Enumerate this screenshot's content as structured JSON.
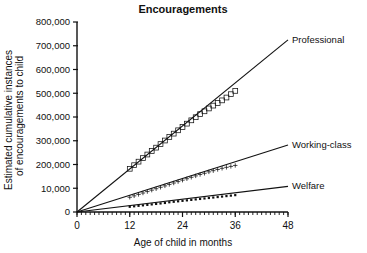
{
  "chart_data": {
    "type": "line",
    "title": "Encouragements",
    "xlabel": "Age of child in months",
    "ylabel": "Estimated cumulative instances of encouragements to child",
    "ylabel_line1": "Estimated cumulative instances",
    "ylabel_line2": "of encouragements to child",
    "xlim": [
      0,
      48
    ],
    "ylim": [
      0,
      800000
    ],
    "grid": false,
    "legend_position": "right-inline",
    "x_ticks": [
      0,
      12,
      24,
      36,
      48
    ],
    "x_tick_labels": [
      "0",
      "12",
      "24",
      "36",
      "48"
    ],
    "x_minor_tick_interval": 1,
    "y_ticks": [
      0,
      100000,
      200000,
      300000,
      400000,
      500000,
      600000,
      700000,
      800000
    ],
    "y_tick_labels": [
      "0",
      "10,000",
      "200,000",
      "300,000",
      "400,000",
      "500,000",
      "600,000",
      "700,000",
      "800,000"
    ],
    "series": [
      {
        "name": "Professional",
        "marker": "open-square",
        "label": "Professional",
        "trend_from": [
          0,
          0
        ],
        "trend_to": [
          48,
          725000
        ],
        "x": [
          12,
          13,
          14,
          15,
          16,
          17,
          18,
          19,
          20,
          21,
          22,
          23,
          24,
          25,
          26,
          27,
          28,
          29,
          30,
          31,
          32,
          33,
          34,
          35,
          36
        ],
        "values": [
          182000,
          197000,
          212000,
          227000,
          242000,
          257000,
          271000,
          286000,
          301000,
          316000,
          330000,
          344000,
          358000,
          372000,
          386000,
          399000,
          412000,
          424000,
          436000,
          448000,
          459000,
          470000,
          482000,
          496000,
          510000
        ]
      },
      {
        "name": "Working-class",
        "marker": "plus",
        "label": "Working-class",
        "trend_from": [
          0,
          0
        ],
        "trend_to": [
          48,
          282000
        ],
        "x": [
          12,
          13,
          14,
          15,
          16,
          17,
          18,
          19,
          20,
          21,
          22,
          23,
          24,
          25,
          26,
          27,
          28,
          29,
          30,
          31,
          32,
          33,
          34,
          35,
          36
        ],
        "values": [
          62000,
          68000,
          74000,
          80000,
          86000,
          92000,
          98000,
          104000,
          110000,
          116000,
          122000,
          128000,
          134000,
          140000,
          146000,
          152000,
          158000,
          163000,
          169000,
          174000,
          179000,
          184000,
          188000,
          192000,
          196000
        ]
      },
      {
        "name": "Welfare",
        "marker": "dot",
        "label": "Welfare",
        "trend_from": [
          0,
          0
        ],
        "trend_to": [
          48,
          108000
        ],
        "x": [
          12,
          13,
          14,
          15,
          16,
          17,
          18,
          19,
          20,
          21,
          22,
          23,
          24,
          25,
          26,
          27,
          28,
          29,
          30,
          31,
          32,
          33,
          34,
          35,
          36
        ],
        "values": [
          22000,
          24000,
          26000,
          28000,
          30000,
          32000,
          34000,
          36000,
          38000,
          41000,
          43000,
          45000,
          47000,
          49000,
          51000,
          53000,
          55000,
          57000,
          59000,
          61000,
          63000,
          65000,
          67000,
          69000,
          71000
        ]
      }
    ]
  },
  "labels": {
    "professional": "Professional",
    "working_class": "Working-class",
    "welfare": "Welfare"
  }
}
